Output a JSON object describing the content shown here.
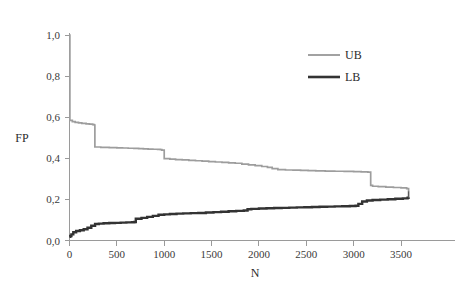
{
  "chart_data": {
    "type": "line",
    "title": "",
    "subtitle": "",
    "xlabel": "N",
    "ylabel": "FP",
    "xlim": [
      0,
      3650
    ],
    "ylim": [
      0.0,
      1.04
    ],
    "grid": false,
    "legend_position": "top-right-inside",
    "x_ticks": [
      0,
      500,
      1000,
      1500,
      2000,
      2500,
      3000,
      3500
    ],
    "x_tick_labels": [
      "0",
      "500",
      "1000",
      "1500",
      "2000",
      "2500",
      "3000",
      "3500"
    ],
    "y_ticks": [
      0.0,
      0.2,
      0.4,
      0.6,
      0.8,
      1.0
    ],
    "y_tick_labels": [
      "0,0",
      "0,2",
      "0,4",
      "0,6",
      "0,8",
      "1,0"
    ],
    "decimal_separator": ",",
    "step_style": "post",
    "series": [
      {
        "name": "UB",
        "color": "#9d9d9d",
        "width": 1.7,
        "direction": "decreasing",
        "x": [
          0,
          4,
          30,
          60,
          95,
          130,
          175,
          210,
          245,
          262,
          268,
          330,
          420,
          500,
          560,
          620,
          680,
          730,
          780,
          830,
          880,
          930,
          960,
          975,
          1000,
          1060,
          1120,
          1190,
          1260,
          1330,
          1400,
          1470,
          1540,
          1610,
          1680,
          1750,
          1820,
          1890,
          1960,
          2030,
          2090,
          2140,
          2200,
          2280,
          2360,
          2440,
          2520,
          2600,
          2700,
          2800,
          2900,
          3000,
          3080,
          3150,
          3180,
          3200,
          3260,
          3340,
          3420,
          3500,
          3560,
          3580
        ],
        "y": [
          1.0,
          0.585,
          0.578,
          0.575,
          0.572,
          0.57,
          0.568,
          0.566,
          0.564,
          0.562,
          0.455,
          0.453,
          0.452,
          0.451,
          0.45,
          0.449,
          0.448,
          0.447,
          0.446,
          0.445,
          0.444,
          0.443,
          0.442,
          0.44,
          0.398,
          0.396,
          0.394,
          0.392,
          0.39,
          0.388,
          0.386,
          0.384,
          0.382,
          0.38,
          0.378,
          0.376,
          0.372,
          0.368,
          0.364,
          0.36,
          0.356,
          0.35,
          0.345,
          0.343,
          0.342,
          0.341,
          0.34,
          0.339,
          0.338,
          0.337,
          0.336,
          0.335,
          0.334,
          0.333,
          0.268,
          0.264,
          0.262,
          0.26,
          0.258,
          0.256,
          0.252,
          0.24
        ]
      },
      {
        "name": "LB",
        "color": "#333333",
        "width": 2.4,
        "direction": "increasing",
        "x": [
          0,
          8,
          20,
          40,
          70,
          110,
          150,
          190,
          230,
          270,
          310,
          360,
          420,
          480,
          540,
          600,
          660,
          685,
          700,
          760,
          820,
          880,
          940,
          1000,
          1060,
          1130,
          1200,
          1280,
          1360,
          1440,
          1520,
          1600,
          1680,
          1760,
          1840,
          1880,
          1920,
          2000,
          2080,
          2160,
          2240,
          2320,
          2400,
          2480,
          2560,
          2640,
          2720,
          2800,
          2880,
          2960,
          3020,
          3050,
          3090,
          3140,
          3200,
          3280,
          3360,
          3440,
          3520,
          3570,
          3580
        ],
        "y": [
          0.018,
          0.022,
          0.03,
          0.04,
          0.046,
          0.05,
          0.055,
          0.062,
          0.072,
          0.08,
          0.082,
          0.084,
          0.085,
          0.086,
          0.087,
          0.088,
          0.089,
          0.09,
          0.106,
          0.11,
          0.115,
          0.12,
          0.125,
          0.127,
          0.129,
          0.131,
          0.132,
          0.133,
          0.134,
          0.136,
          0.138,
          0.14,
          0.142,
          0.144,
          0.146,
          0.152,
          0.154,
          0.156,
          0.157,
          0.158,
          0.159,
          0.16,
          0.161,
          0.162,
          0.163,
          0.164,
          0.165,
          0.166,
          0.167,
          0.168,
          0.169,
          0.178,
          0.19,
          0.195,
          0.197,
          0.199,
          0.201,
          0.203,
          0.205,
          0.208,
          0.21
        ]
      }
    ],
    "annotations": []
  },
  "axes": {
    "y_label": "FP",
    "x_label": "N"
  },
  "legend": {
    "entries": [
      {
        "label": "UB",
        "color": "#9d9d9d"
      },
      {
        "label": "LB",
        "color": "#333333"
      }
    ]
  }
}
